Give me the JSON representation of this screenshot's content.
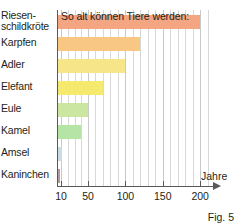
{
  "chart_data": {
    "type": "bar",
    "orientation": "horizontal",
    "title": "So alt können Tiere werden:",
    "xlabel": "Jahre",
    "ylabel": "",
    "categories": [
      "Riesen-schildkröte",
      "Karpfen",
      "Adler",
      "Elefant",
      "Eule",
      "Kamel",
      "Amsel",
      "Kaninchen"
    ],
    "values": [
      200,
      120,
      100,
      70,
      50,
      40,
      12,
      8
    ],
    "xticks": [
      10,
      50,
      100,
      150,
      200
    ],
    "xlim": [
      0,
      215
    ],
    "grid": true,
    "legend": false,
    "bar_colors": [
      "#f4a582",
      "#f9c784",
      "#f7e58a",
      "#f5ea6e",
      "#cbe6a0",
      "#b6e3a6",
      "#c9dbe3",
      "#b09aa0"
    ]
  },
  "chart": {
    "title": "So alt können Tiere werden:",
    "axis_title": "Jahre",
    "caption": "Fig. 5",
    "categories": [
      {
        "label": "Riesen-schildkröte",
        "line1": "Riesen-",
        "line2": "schildkröte",
        "value": 200,
        "color": "#f4a582"
      },
      {
        "label": "Karpfen",
        "line1": "Karpfen",
        "line2": "",
        "value": 120,
        "color": "#f9c784"
      },
      {
        "label": "Adler",
        "line1": "Adler",
        "line2": "",
        "value": 100,
        "color": "#f7e58a"
      },
      {
        "label": "Elefant",
        "line1": "Elefant",
        "line2": "",
        "value": 70,
        "color": "#f5ea6e"
      },
      {
        "label": "Eule",
        "line1": "Eule",
        "line2": "",
        "value": 50,
        "color": "#cbe6a0"
      },
      {
        "label": "Kamel",
        "line1": "Kamel",
        "line2": "",
        "value": 40,
        "color": "#b6e3a6"
      },
      {
        "label": "Amsel",
        "line1": "Amsel",
        "line2": "",
        "value": 12,
        "color": "#c9dbe3"
      },
      {
        "label": "Kaninchen",
        "line1": "Kaninchen",
        "line2": "",
        "value": 8,
        "color": "#b09aa0"
      }
    ],
    "ticks": [
      {
        "label": "10"
      },
      {
        "label": "50"
      },
      {
        "label": "100"
      },
      {
        "label": "150"
      },
      {
        "label": "200"
      }
    ]
  }
}
